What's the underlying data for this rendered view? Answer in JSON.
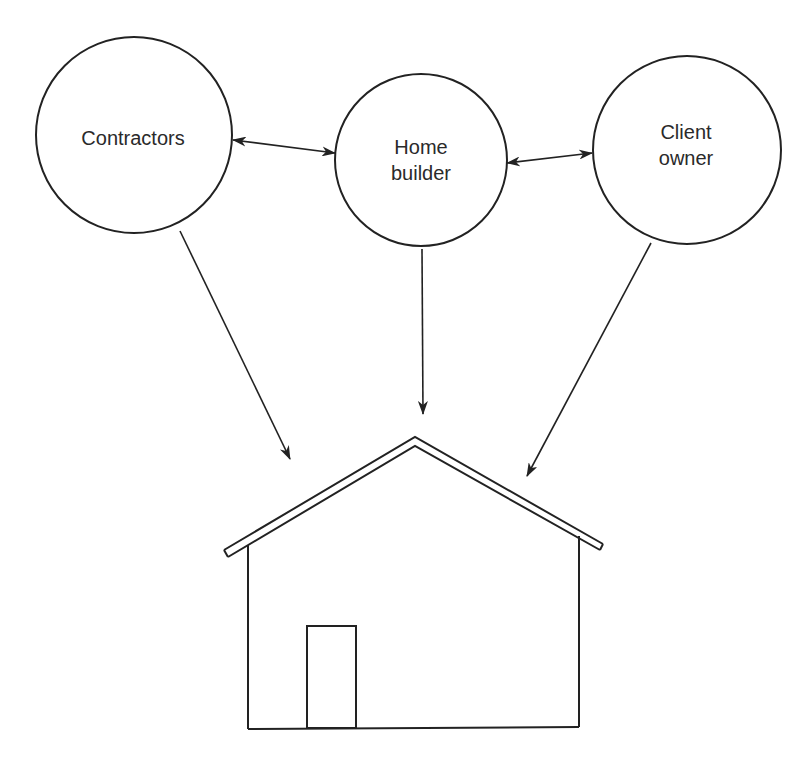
{
  "diagram": {
    "nodes": [
      {
        "id": "contractors",
        "label_lines": [
          "Contractors"
        ],
        "cx": 134,
        "cy": 135,
        "r": 98
      },
      {
        "id": "home-builder",
        "label_lines": [
          "Home",
          "builder"
        ],
        "cx": 421,
        "cy": 160,
        "r": 86
      },
      {
        "id": "client-owner",
        "label_lines": [
          "Client",
          "owner"
        ],
        "cx": 687,
        "cy": 150,
        "r": 94
      }
    ],
    "edges": [
      {
        "from": "contractors",
        "to": "home-builder",
        "type": "bidirectional"
      },
      {
        "from": "home-builder",
        "to": "client-owner",
        "type": "bidirectional"
      },
      {
        "from": "contractors",
        "to": "house",
        "type": "directed"
      },
      {
        "from": "home-builder",
        "to": "house",
        "type": "directed"
      },
      {
        "from": "client-owner",
        "to": "house",
        "type": "directed"
      }
    ],
    "house": {
      "label": "",
      "has_door": true
    },
    "colors": {
      "stroke": "#222222",
      "background": "#ffffff",
      "text": "#2a2a2a"
    }
  },
  "labels": {
    "contractors_line1": "Contractors",
    "home_builder_line1": "Home",
    "home_builder_line2": "builder",
    "client_owner_line1": "Client",
    "client_owner_line2": "owner"
  }
}
